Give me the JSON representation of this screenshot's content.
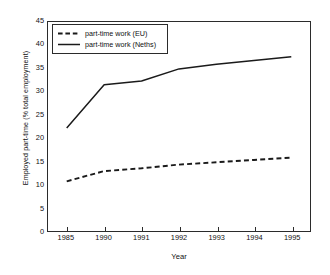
{
  "chart_data": {
    "type": "line",
    "title": "",
    "subtitle": "",
    "xlabel": "Year",
    "ylabel": "Employed part-time (% total employment)",
    "categories": [
      "1985",
      "1990",
      "1991",
      "1992",
      "1993",
      "1994",
      "1995"
    ],
    "x": [
      1985,
      1990,
      1991,
      1992,
      1993,
      1994,
      1995
    ],
    "ylim": [
      0,
      45
    ],
    "yticks": [
      0,
      5,
      10,
      15,
      20,
      25,
      30,
      35,
      40,
      45
    ],
    "ytick_labels": [
      "0",
      "5",
      "10",
      "15",
      "20",
      "25",
      "30",
      "35",
      "40",
      "45"
    ],
    "grid": false,
    "legend_position": "top-left",
    "series": [
      {
        "name": "part-time work (EU)",
        "style": "dashed",
        "color": "#1a1a1a",
        "values": [
          10.7,
          12.9,
          13.5,
          14.3,
          14.8,
          15.3,
          15.8
        ]
      },
      {
        "name": "part-time work (Neths)",
        "style": "solid",
        "color": "#1a1a1a",
        "values": [
          22.2,
          31.5,
          32.3,
          34.9,
          35.9,
          36.7,
          37.5
        ]
      }
    ]
  },
  "legend": {
    "entries": [
      {
        "label": "part-time work (EU)",
        "swatch": "dashed-line-swatch"
      },
      {
        "label": "part-time work (Neths)",
        "swatch": "solid-line-swatch"
      }
    ]
  },
  "axes": {
    "x_title": "Year",
    "y_title": "Employed part-time (% total employment)"
  }
}
